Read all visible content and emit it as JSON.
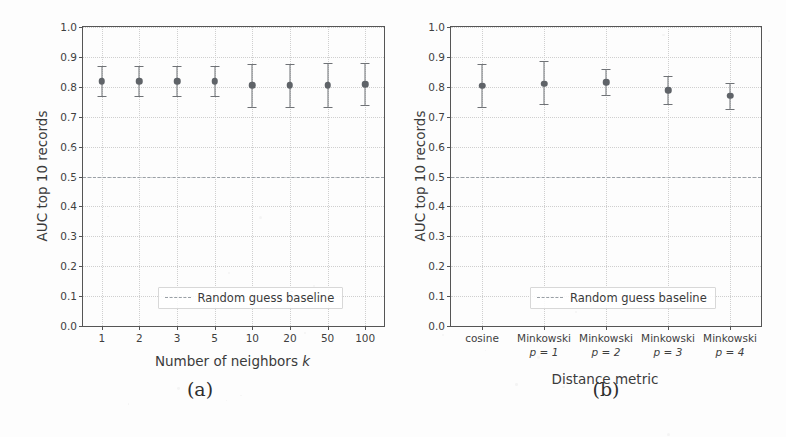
{
  "figure": {
    "background_color": "#fdfdfd",
    "marker_color": "#5f6368",
    "errorbar_color": "#6f7276",
    "baseline_color": "#9aa0a6",
    "grid_color": "#cfcfcf"
  },
  "panels": [
    {
      "caption": "(a)",
      "legend_label": "Random guess baseline",
      "chart_data": {
        "type": "scatter",
        "title": "",
        "xlabel": "Number of neighbors  k",
        "xlabel_main": "Number of neighbors",
        "xlabel_var": "k",
        "ylabel": "AUC top 10 records",
        "ylim": [
          0.0,
          1.0
        ],
        "yticks": [
          "0.0",
          "0.1",
          "0.2",
          "0.3",
          "0.4",
          "0.5",
          "0.6",
          "0.7",
          "0.8",
          "0.9",
          "1.0"
        ],
        "grid": true,
        "legend_position": "lower center",
        "categories": [
          "1",
          "2",
          "3",
          "5",
          "10",
          "20",
          "50",
          "100"
        ],
        "values": [
          0.818,
          0.818,
          0.819,
          0.818,
          0.805,
          0.805,
          0.806,
          0.809
        ],
        "err_low": [
          0.769,
          0.769,
          0.77,
          0.769,
          0.733,
          0.733,
          0.733,
          0.738
        ],
        "err_high": [
          0.868,
          0.868,
          0.869,
          0.868,
          0.877,
          0.877,
          0.878,
          0.88
        ],
        "baseline": 0.5,
        "baseline_label": "Random guess baseline"
      }
    },
    {
      "caption": "(b)",
      "legend_label": "Random guess baseline",
      "chart_data": {
        "type": "scatter",
        "title": "",
        "xlabel": "Distance metric",
        "ylabel": "AUC top 10 records",
        "ylim": [
          0.0,
          1.0
        ],
        "yticks": [
          "0.0",
          "0.1",
          "0.2",
          "0.3",
          "0.4",
          "0.5",
          "0.6",
          "0.7",
          "0.8",
          "0.9",
          "1.0"
        ],
        "grid": true,
        "legend_position": "lower center",
        "categories": [
          "cosine",
          "Minkowski",
          "Minkowski",
          "Minkowski",
          "Minkowski"
        ],
        "category_sub": [
          "",
          "p = 1",
          "p = 2",
          "p = 3",
          "p = 4"
        ],
        "values": [
          0.803,
          0.811,
          0.816,
          0.789,
          0.77
        ],
        "err_low": [
          0.733,
          0.743,
          0.771,
          0.741,
          0.727
        ],
        "err_high": [
          0.875,
          0.886,
          0.859,
          0.835,
          0.812
        ],
        "baseline": 0.5,
        "baseline_label": "Random guess baseline"
      }
    }
  ]
}
